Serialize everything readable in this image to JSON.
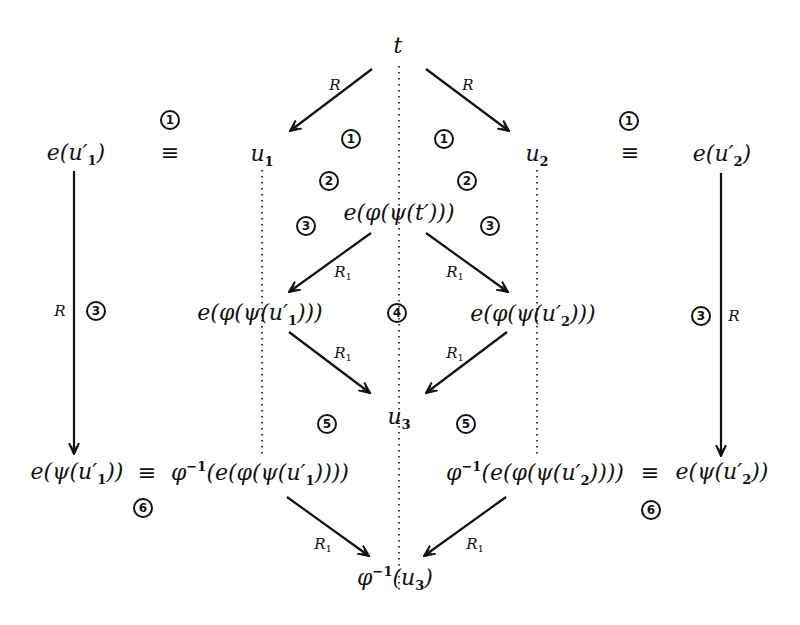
{
  "diagram": {
    "type": "commutative-rewrite-diagram",
    "nodes": {
      "t": {
        "text": "t"
      },
      "u1": {
        "base": "u",
        "sub": "1"
      },
      "u2": {
        "base": "u",
        "sub": "2"
      },
      "e_u1p": {
        "pre": "e(u′",
        "sub": "1",
        "post": ")"
      },
      "e_u2p": {
        "pre": "e(u′",
        "sub": "2",
        "post": ")"
      },
      "e_phi_psi_tp": {
        "text": "e(φ(ψ(t′)))"
      },
      "e_phi_psi_u1p": {
        "pre": "e(φ(ψ(u′",
        "sub": "1",
        "post": ")))"
      },
      "e_phi_psi_u2p": {
        "pre": "e(φ(ψ(u′",
        "sub": "2",
        "post": ")))"
      },
      "u3": {
        "base": "u",
        "sub": "3"
      },
      "e_psi_u1p": {
        "pre": "e(ψ(u′",
        "sub": "1",
        "post": "))"
      },
      "phiinv_e_phi_psi_u1p": {
        "pre1": "φ",
        "sup": "−1",
        "pre2": "(e(φ(ψ(u′",
        "sub": "1",
        "post": "))))"
      },
      "phiinv_e_phi_psi_u2p": {
        "pre1": "φ",
        "sup": "−1",
        "pre2": "(e(φ(ψ(u′",
        "sub": "2",
        "post": "))))"
      },
      "e_psi_u2p": {
        "pre": "e(ψ(u′",
        "sub": "2",
        "post": "))"
      },
      "phiinv_u3": {
        "pre1": "φ",
        "sup": "−1",
        "pre2": "(u",
        "sub": "3",
        "post": ")"
      }
    },
    "equivalence_symbol": "≡",
    "edge_labels": {
      "R": "R",
      "R1": {
        "base": "R",
        "sub": "1"
      }
    },
    "edges": [
      {
        "from": "t",
        "to": "u1",
        "label": "R"
      },
      {
        "from": "t",
        "to": "u2",
        "label": "R"
      },
      {
        "from": "e_phi_psi_tp",
        "to": "e_phi_psi_u1p",
        "label": "R1"
      },
      {
        "from": "e_phi_psi_tp",
        "to": "e_phi_psi_u2p",
        "label": "R1"
      },
      {
        "from": "e_phi_psi_u1p",
        "to": "u3",
        "label": "R1"
      },
      {
        "from": "e_phi_psi_u2p",
        "to": "u3",
        "label": "R1"
      },
      {
        "from": "e_u1p",
        "to": "e_psi_u1p",
        "label": "R"
      },
      {
        "from": "e_u2p",
        "to": "e_psi_u2p",
        "label": "R"
      },
      {
        "from": "phiinv_e_phi_psi_u1p",
        "to": "phiinv_u3",
        "label": "R1"
      },
      {
        "from": "phiinv_e_phi_psi_u2p",
        "to": "phiinv_u3",
        "label": "R1"
      }
    ],
    "step_markers": {
      "m1_left_equiv": "1",
      "m1_left_inner": "1",
      "m1_right_inner": "1",
      "m1_right_equiv": "1",
      "m2_left": "2",
      "m2_right": "2",
      "m3_left_inner": "3",
      "m3_right_inner": "3",
      "m3_left_outer": "3",
      "m3_right_outer": "3",
      "m4_center": "4",
      "m5_left": "5",
      "m5_right": "5",
      "m6_left": "6",
      "m6_right": "6"
    },
    "colors": {
      "ink": "#111111",
      "background": "#ffffff"
    }
  }
}
